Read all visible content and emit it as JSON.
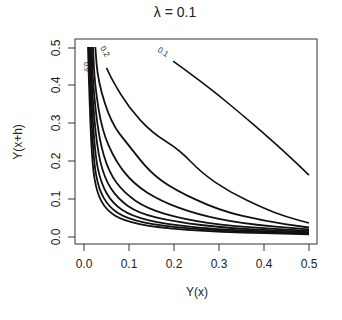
{
  "chart_data": {
    "type": "line",
    "subtype": "contour",
    "title": "λ = 0.1",
    "xlabel": "Y(x)",
    "ylabel": "Y(x+h)",
    "xlim": [
      0.0,
      0.5
    ],
    "ylim": [
      0.0,
      0.5
    ],
    "xticks": [
      "0.0",
      "0.1",
      "0.2",
      "0.3",
      "0.4",
      "0.5"
    ],
    "yticks": [
      "0.0",
      "0.1",
      "0.2",
      "0.3",
      "0.4",
      "0.5"
    ],
    "grid": false,
    "legend": null,
    "series": [
      {
        "name": "0.1",
        "label": "0.1",
        "points": [
          [
            0.198,
            0.463
          ],
          [
            0.25,
            0.418
          ],
          [
            0.3,
            0.372
          ],
          [
            0.35,
            0.323
          ],
          [
            0.4,
            0.272
          ],
          [
            0.45,
            0.219
          ],
          [
            0.5,
            0.163
          ]
        ]
      },
      {
        "name": "0.2",
        "label": "0.2",
        "points": [
          [
            0.05,
            0.445
          ],
          [
            0.064,
            0.41
          ],
          [
            0.1,
            0.34
          ],
          [
            0.15,
            0.275
          ],
          [
            0.213,
            0.229
          ],
          [
            0.26,
            0.17
          ],
          [
            0.324,
            0.118
          ],
          [
            0.4,
            0.075
          ],
          [
            0.45,
            0.053
          ],
          [
            0.5,
            0.037
          ]
        ]
      },
      {
        "name": "0.3",
        "label": "",
        "points": [
          [
            0.025,
            0.5
          ],
          [
            0.031,
            0.41
          ],
          [
            0.06,
            0.3
          ],
          [
            0.1,
            0.24
          ],
          [
            0.147,
            0.17
          ],
          [
            0.2,
            0.125
          ],
          [
            0.3,
            0.07
          ],
          [
            0.4,
            0.042
          ],
          [
            0.5,
            0.025
          ]
        ]
      },
      {
        "name": "0.4",
        "label": "",
        "points": [
          [
            0.02,
            0.5
          ],
          [
            0.024,
            0.4
          ],
          [
            0.04,
            0.28
          ],
          [
            0.07,
            0.2
          ],
          [
            0.11,
            0.14
          ],
          [
            0.17,
            0.095
          ],
          [
            0.25,
            0.06
          ],
          [
            0.35,
            0.035
          ],
          [
            0.5,
            0.02
          ]
        ]
      },
      {
        "name": "0.5",
        "label": "",
        "points": [
          [
            0.017,
            0.5
          ],
          [
            0.02,
            0.4
          ],
          [
            0.033,
            0.26
          ],
          [
            0.055,
            0.17
          ],
          [
            0.09,
            0.115
          ],
          [
            0.14,
            0.075
          ],
          [
            0.22,
            0.047
          ],
          [
            0.33,
            0.028
          ],
          [
            0.5,
            0.016
          ]
        ]
      },
      {
        "name": "0.6",
        "label": "",
        "points": [
          [
            0.015,
            0.5
          ],
          [
            0.017,
            0.4
          ],
          [
            0.028,
            0.24
          ],
          [
            0.045,
            0.155
          ],
          [
            0.075,
            0.1
          ],
          [
            0.12,
            0.063
          ],
          [
            0.2,
            0.04
          ],
          [
            0.32,
            0.023
          ],
          [
            0.5,
            0.013
          ]
        ]
      },
      {
        "name": "0.7",
        "label": "",
        "points": [
          [
            0.013,
            0.5
          ],
          [
            0.015,
            0.4
          ],
          [
            0.024,
            0.22
          ],
          [
            0.038,
            0.14
          ],
          [
            0.064,
            0.088
          ],
          [
            0.105,
            0.055
          ],
          [
            0.18,
            0.034
          ],
          [
            0.3,
            0.019
          ],
          [
            0.5,
            0.011
          ]
        ]
      },
      {
        "name": "0.8",
        "label": "",
        "points": [
          [
            0.011,
            0.5
          ],
          [
            0.013,
            0.4
          ],
          [
            0.021,
            0.2
          ],
          [
            0.033,
            0.125
          ],
          [
            0.056,
            0.078
          ],
          [
            0.095,
            0.048
          ],
          [
            0.17,
            0.029
          ],
          [
            0.3,
            0.016
          ],
          [
            0.5,
            0.009
          ]
        ]
      },
      {
        "name": "0.9",
        "label": "0.9",
        "points": [
          [
            0.009,
            0.5
          ],
          [
            0.011,
            0.4
          ],
          [
            0.018,
            0.19
          ],
          [
            0.029,
            0.115
          ],
          [
            0.05,
            0.07
          ],
          [
            0.087,
            0.043
          ],
          [
            0.16,
            0.025
          ],
          [
            0.3,
            0.013
          ],
          [
            0.5,
            0.007
          ]
        ]
      }
    ]
  },
  "colors": {
    "line": "#111111",
    "axis": "#333333",
    "background": "#ffffff"
  }
}
